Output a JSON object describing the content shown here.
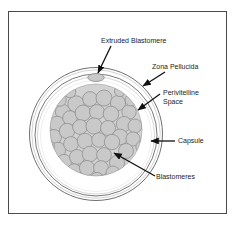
{
  "figure": {
    "background_color": "#ffffff",
    "frame_color": "#4a4a52",
    "cell_fill": "#c9c9c9",
    "cell_stroke": "#8a8a8a",
    "ring_stroke": "#5a5a5a",
    "arrow_color": "#101010",
    "text_color": "#1c1c1c"
  },
  "labels": {
    "extruded_blastomere": "Extruded Blastomere",
    "zona_pellucida": "Zona Pellucida",
    "perivitelline_space_line1": "Perivitelline",
    "perivitelline_space_line2": "Space",
    "capsule": "Capsule",
    "blastomeres": "Blastomeres"
  },
  "structures": {
    "capsule_ring": "outer-circle",
    "zona_pellucida_ring": "inner-circle",
    "perivitelline_space": "gap-between-rings-and-cluster",
    "blastomere_cluster": "packed-gray-cells",
    "extruded_blastomere": "small-ellipse-top"
  }
}
